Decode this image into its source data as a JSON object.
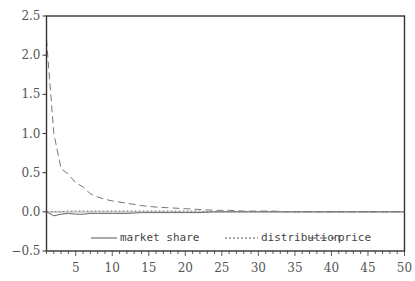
{
  "chart_data": {
    "type": "line",
    "title": "",
    "xlabel": "",
    "ylabel": "",
    "xlim": [
      1,
      50
    ],
    "ylim": [
      -0.5,
      2.5
    ],
    "grid": false,
    "legend_position": "bottom-inside",
    "x_ticks": [
      5,
      10,
      15,
      20,
      25,
      30,
      35,
      40,
      45,
      50
    ],
    "y_ticks": [
      -0.5,
      0.0,
      0.5,
      1.0,
      1.5,
      2.0,
      2.5
    ],
    "x_tick_labels": [
      "5",
      "10",
      "15",
      "20",
      "25",
      "30",
      "35",
      "40",
      "45",
      "50"
    ],
    "y_tick_labels": [
      "−0.5",
      "0.0",
      "0.5",
      "1.0",
      "1.5",
      "2.0",
      "2.5"
    ],
    "x": [
      1,
      2,
      3,
      4,
      5,
      6,
      7,
      8,
      9,
      10,
      12,
      14,
      16,
      18,
      20,
      22,
      24,
      26,
      28,
      30,
      32,
      34,
      36,
      38,
      40,
      45,
      50
    ],
    "series": [
      {
        "name": "market share",
        "style": "solid",
        "values": [
          0.0,
          -0.05,
          -0.03,
          -0.02,
          -0.03,
          -0.03,
          -0.02,
          -0.02,
          -0.02,
          -0.02,
          -0.02,
          -0.01,
          -0.01,
          -0.01,
          -0.01,
          -0.01,
          0.0,
          0.0,
          0.0,
          0.0,
          0.0,
          0.0,
          0.0,
          0.0,
          0.0,
          0.0,
          0.0
        ]
      },
      {
        "name": "distribution",
        "style": "dotted",
        "values": [
          0.0,
          0.0,
          0.0,
          0.01,
          0.01,
          0.01,
          0.01,
          0.01,
          0.01,
          0.01,
          0.01,
          0.01,
          0.01,
          0.01,
          0.01,
          0.01,
          0.0,
          0.0,
          0.0,
          0.0,
          0.0,
          0.0,
          0.0,
          0.0,
          0.0,
          0.0,
          0.0
        ]
      },
      {
        "name": "price",
        "style": "dashed",
        "values": [
          2.2,
          1.0,
          0.55,
          0.48,
          0.37,
          0.32,
          0.23,
          0.19,
          0.16,
          0.14,
          0.11,
          0.08,
          0.06,
          0.05,
          0.04,
          0.03,
          0.02,
          0.02,
          0.01,
          0.01,
          0.01,
          0.0,
          0.0,
          0.0,
          0.0,
          0.0,
          0.0
        ]
      }
    ]
  },
  "legend": {
    "items": [
      {
        "label": "market share",
        "style": "solid"
      },
      {
        "label": "distribution",
        "style": "dotted"
      },
      {
        "label": "price",
        "style": "dashed"
      }
    ]
  }
}
